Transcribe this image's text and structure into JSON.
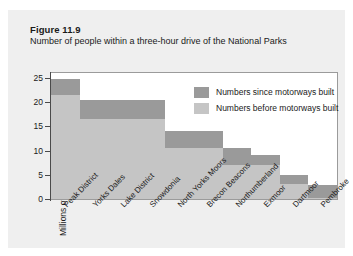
{
  "figure": {
    "number_label": "Figure 11.9",
    "caption": "Number of people within a three-hour drive of the National Parks"
  },
  "legend": {
    "position": "inside-top-right",
    "entries": [
      {
        "label": "Numbers since motorways built",
        "color": "#9a9a9a"
      },
      {
        "label": "Numbers before motorways built",
        "color": "#c5c5c5"
      }
    ]
  },
  "axes": {
    "y_title": "Millions of people within a 3 hour drive",
    "y_ticks": [
      "0",
      "5",
      "10",
      "15",
      "20",
      "25"
    ],
    "x_title": ""
  },
  "chart_data": {
    "type": "bar",
    "title": "Number of people within a three-hour drive of the National Parks",
    "xlabel": "",
    "ylabel": "Millions of people within a 3 hour drive",
    "ylim": [
      0,
      26
    ],
    "yticks": [
      0,
      5,
      10,
      15,
      20,
      25
    ],
    "grid": false,
    "legend": "inside top right",
    "stacked": true,
    "categories": [
      "Peak District",
      "Yorks Dales",
      "Lake District",
      "Snowdonia",
      "North Yorks Moors",
      "Brecon Beacons",
      "Northumberland",
      "Exmoor",
      "Dartmoor",
      "Pembroke"
    ],
    "series": [
      {
        "name": "Numbers before motorways built",
        "color": "#c5c5c5",
        "values": [
          21.5,
          16.5,
          16.5,
          16.5,
          10.5,
          10.5,
          7.0,
          7.0,
          3.0,
          0.3
        ]
      },
      {
        "name": "Numbers since motorways built",
        "color": "#9a9a9a",
        "values": [
          3.3,
          4.0,
          4.0,
          4.0,
          3.5,
          3.5,
          3.5,
          2.0,
          2.0,
          2.5
        ]
      }
    ],
    "totals": [
      24.8,
      20.5,
      20.5,
      20.5,
      14.0,
      14.0,
      10.5,
      9.0,
      5.0,
      2.8
    ]
  },
  "colors": {
    "card_background": "#efefef",
    "plot_background": "#ffffff",
    "frame": "#9b9b9b",
    "axis": "#4a4a4a",
    "text": "#1a1a1a"
  }
}
